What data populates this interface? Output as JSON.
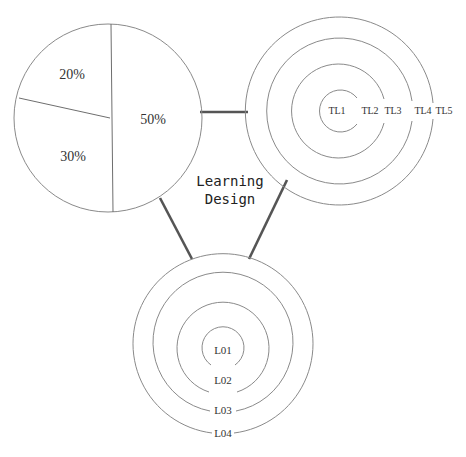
{
  "diagram": {
    "center_title": {
      "line1": "Learning",
      "line2": "Design"
    },
    "pie": {
      "slices": [
        {
          "label": "50%",
          "value": 50
        },
        {
          "label": "20%",
          "value": 20
        },
        {
          "label": "30%",
          "value": 30
        }
      ]
    },
    "teaching_levels": {
      "rings": [
        "TL1",
        "TL2",
        "TL3",
        "TL4",
        "TL5"
      ]
    },
    "learning_outcomes": {
      "rings": [
        "L01",
        "L02",
        "L03",
        "L04"
      ]
    },
    "colors": {
      "stroke": "#8a8a8a",
      "connector": "#555555",
      "text": "#333333",
      "background": "#ffffff"
    }
  }
}
